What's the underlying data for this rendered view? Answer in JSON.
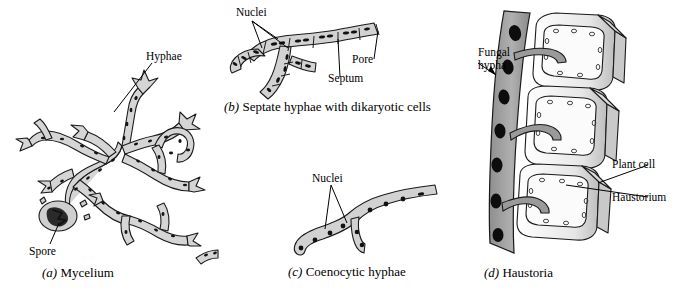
{
  "figure": {
    "background_color": "#ffffff",
    "ink_color": "#000000",
    "fill_light": "#d8d8d8",
    "fill_mid": "#b9b9b9",
    "fill_dark": "#6e6e6e",
    "nucleus_color": "#111111"
  },
  "panels": [
    {
      "id": "a",
      "letter": "(a)",
      "caption": "Mycelium",
      "labels": [
        {
          "name": "hyphae",
          "text": "Hyphae"
        },
        {
          "name": "spore",
          "text": "Spore"
        }
      ]
    },
    {
      "id": "b",
      "letter": "(b)",
      "caption": "Septate hyphae with dikaryotic cells",
      "labels": [
        {
          "name": "nuclei",
          "text": "Nuclei"
        },
        {
          "name": "pore",
          "text": "Pore"
        },
        {
          "name": "septum",
          "text": "Septum"
        }
      ]
    },
    {
      "id": "c",
      "letter": "(c)",
      "caption": "Coenocytic hyphae",
      "labels": [
        {
          "name": "nuclei",
          "text": "Nuclei"
        }
      ]
    },
    {
      "id": "d",
      "letter": "(d)",
      "caption": "Haustoria",
      "labels": [
        {
          "name": "fungal-hypha-line1",
          "text": "Fungal"
        },
        {
          "name": "fungal-hypha-line2",
          "text": "hypha"
        },
        {
          "name": "plant-cell",
          "text": "Plant cell"
        },
        {
          "name": "haustorium",
          "text": "Haustorium"
        }
      ]
    }
  ]
}
